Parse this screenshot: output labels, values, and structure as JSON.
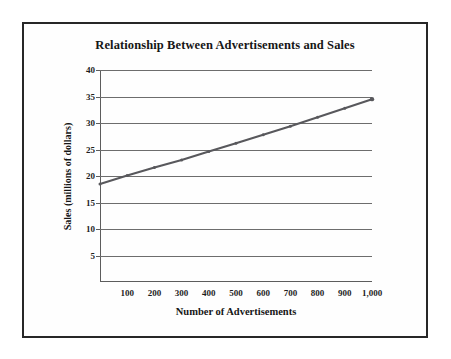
{
  "chart_data": {
    "type": "line",
    "title": "Relationship Between Advertisements and Sales",
    "xlabel": "Number of Advertisements",
    "ylabel": "Sales (millions of dollars)",
    "xlim": [
      0,
      1000
    ],
    "ylim": [
      0,
      40
    ],
    "grid": true,
    "grid_orientation": "horizontal",
    "legend": "none",
    "x_tick_labels": [
      "100",
      "200",
      "300",
      "400",
      "500",
      "600",
      "700",
      "800",
      "900",
      "1,000"
    ],
    "x_tick_values": [
      100,
      200,
      300,
      400,
      500,
      600,
      700,
      800,
      900,
      1000
    ],
    "y_tick_labels": [
      "5",
      "10",
      "15",
      "20",
      "25",
      "30",
      "35",
      "40"
    ],
    "y_tick_values": [
      5,
      10,
      15,
      20,
      25,
      30,
      35,
      40
    ],
    "series": [
      {
        "name": "Sales",
        "color": "#58585c",
        "marker": "dot",
        "x": [
          0,
          100,
          200,
          300,
          400,
          500,
          600,
          700,
          800,
          900,
          1000
        ],
        "values": [
          18.5,
          20.1,
          21.6,
          23.0,
          24.6,
          26.2,
          27.8,
          29.4,
          31.1,
          32.8,
          34.5
        ]
      }
    ]
  },
  "colors": {
    "frame_border": "#272727",
    "gridline": "#6d6d6d",
    "axis": "#5d5d5d",
    "line": "#58585c",
    "text": "#161616",
    "background": "#ffffff"
  }
}
